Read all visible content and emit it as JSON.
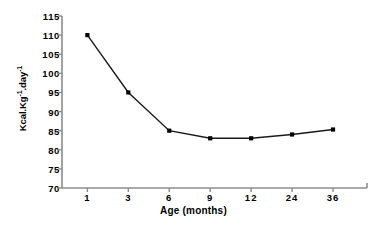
{
  "chart_data": {
    "type": "line",
    "title": "",
    "xlabel": "Age (months)",
    "ylabel": "Kcal.Kg-1.day-1",
    "ylabel_parts": {
      "base1": "Kcal.Kg",
      "sup1": "-1",
      "base2": ".day",
      "sup2": "-1"
    },
    "categories": [
      "1",
      "3",
      "6",
      "9",
      "12",
      "24",
      "36"
    ],
    "values": [
      110,
      95,
      85,
      83,
      83,
      84,
      85.3
    ],
    "series": [
      {
        "name": "Energy requirement",
        "values": [
          110,
          95,
          85,
          83,
          83,
          84,
          85.3
        ]
      }
    ],
    "yticks": [
      70,
      75,
      80,
      85,
      90,
      95,
      100,
      105,
      110,
      115
    ],
    "ylim": [
      70,
      115
    ],
    "grid": false,
    "legend": false,
    "marker": "square",
    "colors": {
      "line": "#1a1a1a",
      "marker": "#000000",
      "axis": "#8c8c8c",
      "text": "#000000",
      "background": "#ffffff"
    }
  }
}
